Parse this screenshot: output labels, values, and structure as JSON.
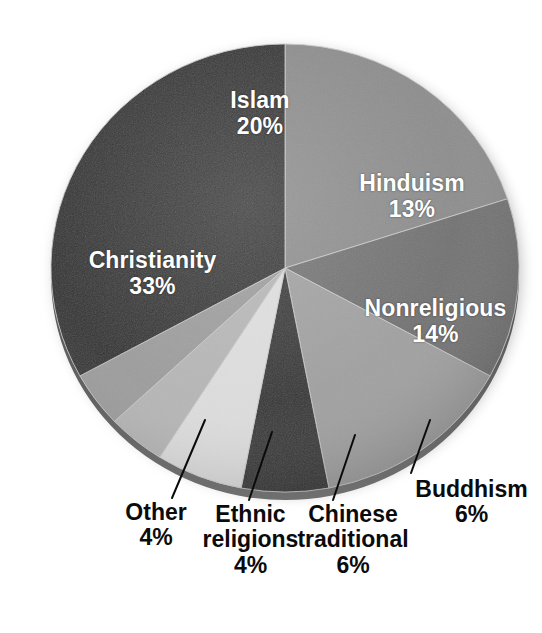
{
  "chart_data": {
    "type": "pie",
    "title": "",
    "subtitle": "",
    "xlabel": "",
    "ylabel": "",
    "legend_position": "none",
    "grid": false,
    "units": "percent",
    "total": 100,
    "start_angle_deg": 0,
    "direction": "clockwise",
    "categories": [
      "Islam",
      "Hinduism",
      "Nonreligious",
      "Buddhism",
      "Chinese traditional",
      "Ethnic religions",
      "Other",
      "Christianity"
    ],
    "values": [
      20,
      13,
      14,
      6,
      6,
      4,
      4,
      33
    ],
    "slices": [
      {
        "label": "Islam",
        "label_line1": "Islam",
        "label_line2": "",
        "value": 20,
        "value_text": "20%",
        "color": "#8a8a8a",
        "label_placement": "inside"
      },
      {
        "label": "Hinduism",
        "label_line1": "Hinduism",
        "label_line2": "",
        "value": 13,
        "value_text": "13%",
        "color": "#6e6e6e",
        "label_placement": "inside"
      },
      {
        "label": "Nonreligious",
        "label_line1": "Nonreligious",
        "label_line2": "",
        "value": 14,
        "value_text": "14%",
        "color": "#9e9e9e",
        "label_placement": "inside"
      },
      {
        "label": "Buddhism",
        "label_line1": "Buddhism",
        "label_line2": "",
        "value": 6,
        "value_text": "6%",
        "color": "#2e2e2e",
        "label_placement": "callout"
      },
      {
        "label": "Chinese traditional",
        "label_line1": "Chinese",
        "label_line2": "traditional",
        "value": 6,
        "value_text": "6%",
        "color": "#dcdcdc",
        "label_placement": "callout"
      },
      {
        "label": "Ethnic religions",
        "label_line1": "Ethnic",
        "label_line2": "religions",
        "value": 4,
        "value_text": "4%",
        "color": "#b4b4b4",
        "label_placement": "callout"
      },
      {
        "label": "Other",
        "label_line1": "Other",
        "label_line2": "",
        "value": 4,
        "value_text": "4%",
        "color": "#9a9a9a",
        "label_placement": "callout"
      },
      {
        "label": "Christianity",
        "label_line1": "Christianity",
        "label_line2": "",
        "value": 33,
        "value_text": "33%",
        "color": "#2b2b2b",
        "label_placement": "inside"
      }
    ]
  },
  "colors": {
    "background": "#ffffff",
    "inside_label_text": "#ffffff",
    "callout_label_text": "#0b0b0b",
    "leader_line": "#0b0b0b",
    "slice_divider": "#c9c9c9",
    "rim_shadow": "#4a4a4a"
  }
}
